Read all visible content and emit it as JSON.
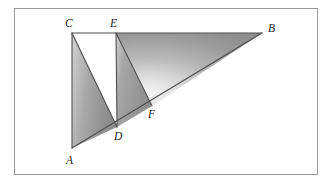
{
  "figure": {
    "kind": "geometry-diagram",
    "frame": {
      "x": 14,
      "y": 8,
      "width": 304,
      "height": 167,
      "border_color": "#9a9a9a",
      "background": "#ffffff"
    },
    "points": [
      {
        "id": "A",
        "label": "A",
        "x": 72,
        "y": 148,
        "label_x": 66,
        "label_y": 155
      },
      {
        "id": "C",
        "label": "C",
        "x": 72,
        "y": 33,
        "label_x": 65,
        "label_y": 18
      },
      {
        "id": "E",
        "label": "E",
        "x": 116,
        "y": 33,
        "label_x": 110,
        "label_y": 18
      },
      {
        "id": "B",
        "label": "B",
        "x": 262,
        "y": 33,
        "label_x": 268,
        "label_y": 23
      },
      {
        "id": "D",
        "label": "D",
        "x": 117,
        "y": 127,
        "label_x": 114,
        "label_y": 131
      },
      {
        "id": "F",
        "label": "F",
        "x": 152,
        "y": 106,
        "label_x": 148,
        "label_y": 109
      }
    ],
    "segments": [
      {
        "id": "AC",
        "from": "A",
        "to": "C"
      },
      {
        "id": "CE",
        "from": "C",
        "to": "E"
      },
      {
        "id": "EB",
        "from": "E",
        "to": "B"
      },
      {
        "id": "AB",
        "from": "A",
        "to": "B"
      },
      {
        "id": "CD",
        "from": "C",
        "to": "D"
      },
      {
        "id": "ED",
        "from": "E",
        "to": "D"
      },
      {
        "id": "EF",
        "from": "E",
        "to": "F"
      }
    ],
    "regions": [
      {
        "id": "ACD",
        "vertices": [
          "A",
          "C",
          "D"
        ],
        "fill": "gradient-acd"
      },
      {
        "id": "EDF",
        "vertices": [
          "E",
          "D",
          "F"
        ],
        "fill": "gradient-edf"
      },
      {
        "id": "EFB",
        "vertices": [
          "E",
          "F",
          "B"
        ],
        "fill": "gradient-efb"
      }
    ],
    "colors": {
      "stroke": "#4d4d4d",
      "shade_dark": "#8d8d8d",
      "shade_mid": "#a8a8a8",
      "shade_light": "#d9d9d9",
      "shade_highlight": "#f2f2f2",
      "label": "#1a1a1a",
      "frame_border": "#9a9a9a",
      "background": "#ffffff"
    }
  }
}
